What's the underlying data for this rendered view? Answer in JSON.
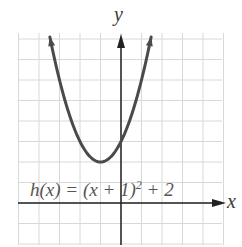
{
  "chart_data": {
    "type": "line",
    "title": "",
    "equation": "h(x) = (x + 1)^2 + 2",
    "function": "h(x) = (x+1)^2 + 2",
    "xlabel": "x",
    "ylabel": "y",
    "xlim": [
      -5,
      5
    ],
    "ylim": [
      -2,
      8
    ],
    "grid": true,
    "grid_step": 1,
    "vertex": [
      -1,
      2
    ],
    "series": [
      {
        "name": "h(x)",
        "color": "#4a4a4a",
        "x": [
          -4.5,
          -4,
          -3,
          -2,
          -1,
          0,
          1,
          1.5
        ],
        "y": [
          14.25,
          11,
          6,
          3,
          2,
          3,
          6,
          8.25
        ]
      }
    ],
    "annotations": [
      "h(x) = (x + 1)^2 + 2"
    ]
  },
  "labels": {
    "x_axis": "x",
    "y_axis": "y",
    "eq_main": "h(x) = (x + 1)",
    "eq_exp": "2",
    "eq_tail": " + 2"
  },
  "colors": {
    "grid": "#d8d8d8",
    "axis": "#222222",
    "curve": "#4a4a4a"
  }
}
